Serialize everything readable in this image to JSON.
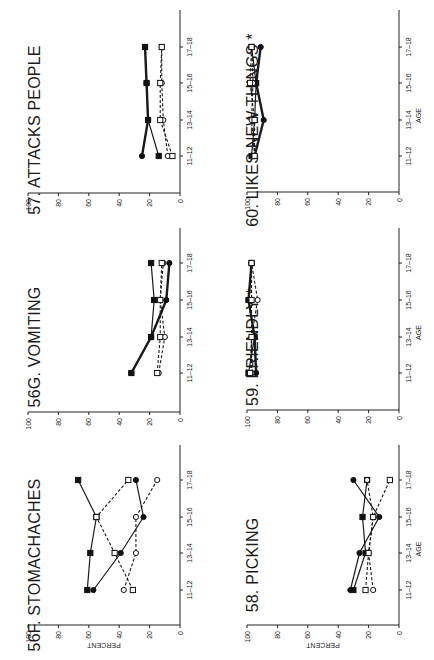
{
  "figure": {
    "orientation": "rotated 90 degrees counter-clockwise",
    "y_axis_label": "PERCENT",
    "x_axis_label": "AGE",
    "age_groups": [
      "11-12",
      "13-14",
      "15-16",
      "17-18"
    ],
    "percent_ticks": [
      "100",
      "80",
      "60",
      "40",
      "20",
      "0"
    ],
    "marker_legend_note": "Series distinguished by marker: filled circle, filled square, open circle, open square; solid lines connect filled markers, dashed lines connect open markers"
  },
  "chart_data": [
    {
      "type": "line",
      "title": "57. ATTACKS PEOPLE",
      "xlabel": "",
      "ylabel": "",
      "ylim": [
        0,
        100
      ],
      "categories": [
        "11-12",
        "13-14",
        "15-16",
        "17-18"
      ],
      "series": [
        {
          "name": "filled circle",
          "style": "thick",
          "values": [
            25,
            21,
            22,
            23
          ]
        },
        {
          "name": "filled square",
          "style": "solid",
          "values": [
            14,
            21,
            22,
            23
          ]
        },
        {
          "name": "open circle",
          "style": "dashed",
          "values": [
            8,
            11,
            12,
            12
          ]
        },
        {
          "name": "open square",
          "style": "dashed",
          "values": [
            5,
            13,
            13,
            12
          ]
        }
      ]
    },
    {
      "type": "line",
      "title": "56G. VOMITING",
      "xlabel": "",
      "ylabel": "",
      "ylim": [
        0,
        100
      ],
      "categories": [
        "11-12",
        "13-14",
        "15-16",
        "17-18"
      ],
      "series": [
        {
          "name": "filled circle",
          "style": "thick",
          "values": [
            32,
            19,
            9,
            7
          ]
        },
        {
          "name": "filled square",
          "style": "solid",
          "values": [
            32,
            19,
            17,
            19
          ]
        },
        {
          "name": "open circle",
          "style": "dashed",
          "values": [
            14,
            10,
            13,
            11
          ]
        },
        {
          "name": "open square",
          "style": "dashed",
          "values": [
            15,
            13,
            13,
            12
          ]
        }
      ]
    },
    {
      "type": "line",
      "title": "56F. STOMACHACHES",
      "xlabel": "",
      "ylabel": "PERCENT",
      "ylim": [
        0,
        100
      ],
      "categories": [
        "11-12",
        "13-14",
        "15-16",
        "17-18"
      ],
      "series": [
        {
          "name": "filled circle",
          "style": "solid",
          "values": [
            57,
            39,
            24,
            29
          ]
        },
        {
          "name": "filled square",
          "style": "solid",
          "values": [
            61,
            59,
            55,
            67
          ]
        },
        {
          "name": "open circle",
          "style": "dashed",
          "values": [
            37,
            29,
            29,
            15
          ]
        },
        {
          "name": "open square",
          "style": "dashed",
          "values": [
            31,
            43,
            55,
            34
          ]
        }
      ]
    },
    {
      "type": "line",
      "title": "60. LIKES NEW THINGS *",
      "xlabel": "AGE",
      "ylabel": "",
      "ylim": [
        0,
        100
      ],
      "categories": [
        "11-12",
        "13-14",
        "15-16",
        "17-18"
      ],
      "series": [
        {
          "name": "filled circle",
          "style": "thick",
          "values": [
            95,
            89,
            94,
            91
          ]
        },
        {
          "name": "filled square",
          "style": "solid",
          "values": [
            97,
            95,
            94,
            97
          ]
        },
        {
          "name": "open circle",
          "style": "dashed",
          "values": [
            95,
            97,
            96,
            97
          ]
        },
        {
          "name": "open square",
          "style": "dashed",
          "values": [
            95,
            95,
            98,
            97
          ]
        }
      ]
    },
    {
      "type": "line",
      "title": "59. FRIENDLY *",
      "xlabel": "AGE",
      "ylabel": "",
      "ylim": [
        0,
        100
      ],
      "categories": [
        "11-12",
        "13-14",
        "15-16",
        "17-18"
      ],
      "series": [
        {
          "name": "filled circle",
          "style": "thick",
          "values": [
            94,
            95,
            99,
            97
          ]
        },
        {
          "name": "filled square",
          "style": "solid",
          "values": [
            99,
            95,
            99,
            97
          ]
        },
        {
          "name": "open circle",
          "style": "dashed",
          "values": [
            97,
            97,
            93,
            97
          ]
        },
        {
          "name": "open square",
          "style": "dashed",
          "values": [
            98,
            97,
            97,
            97
          ]
        }
      ]
    },
    {
      "type": "line",
      "title": "58. PICKING",
      "xlabel": "AGE",
      "ylabel": "PERCENT",
      "ylim": [
        0,
        100
      ],
      "categories": [
        "11-12",
        "13-14",
        "15-16",
        "17-18"
      ],
      "series": [
        {
          "name": "filled circle",
          "style": "solid",
          "values": [
            32,
            26,
            13,
            30
          ]
        },
        {
          "name": "filled square",
          "style": "solid",
          "values": [
            30,
            22,
            24,
            21
          ]
        },
        {
          "name": "open circle",
          "style": "dashed",
          "values": [
            17,
            20,
            17,
            21
          ]
        },
        {
          "name": "open square",
          "style": "dashed",
          "values": [
            22,
            20,
            17,
            6
          ]
        }
      ]
    }
  ],
  "layout": {
    "panels": [
      {
        "axis0_x": 180,
        "axis100_x": 28,
        "axis_y": 193,
        "top_y": 10,
        "age_y": [
          156,
          120,
          83,
          47
        ],
        "title_x": 40,
        "title_y": 130
      },
      {
        "axis0_x": 180,
        "axis100_x": 28,
        "axis_y": 412,
        "top_y": 228,
        "age_y": [
          373,
          337,
          300,
          263
        ],
        "title_x": 40,
        "title_y": 347
      },
      {
        "axis0_x": 180,
        "axis100_x": 28,
        "axis_y": 625,
        "top_y": 445,
        "age_y": [
          590,
          553,
          517,
          480
        ],
        "title_x": 40,
        "title_y": 565
      },
      {
        "axis0_x": 399,
        "axis100_x": 247,
        "axis_y": 192,
        "top_y": 10,
        "age_y": [
          156,
          120,
          83,
          47
        ],
        "title_x": 258,
        "title_y": 130
      },
      {
        "axis0_x": 399,
        "axis100_x": 247,
        "axis_y": 410,
        "top_y": 228,
        "age_y": [
          373,
          337,
          300,
          263
        ],
        "title_x": 258,
        "title_y": 347
      },
      {
        "axis0_x": 399,
        "axis100_x": 247,
        "axis_y": 625,
        "top_y": 445,
        "age_y": [
          590,
          553,
          517,
          480
        ],
        "title_x": 258,
        "title_y": 565
      }
    ]
  }
}
